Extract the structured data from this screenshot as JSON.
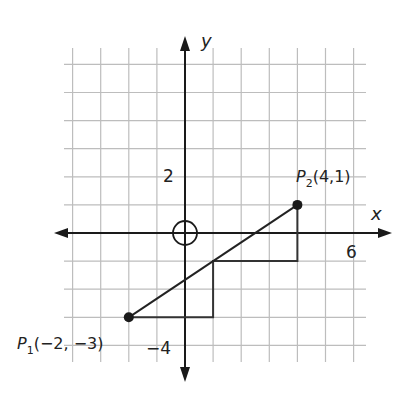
{
  "figure": {
    "axes": {
      "x_label": "x",
      "y_label": "y",
      "x_tick_label": "6",
      "y_tick_label_pos": "2",
      "y_tick_label_neg": "−4"
    },
    "origin_marker": "circle-crosshair",
    "points": [
      {
        "name": "P",
        "sub": "1",
        "coords": "(−2, −3)",
        "x": -2,
        "y": -3
      },
      {
        "name": "P",
        "sub": "2",
        "coords": "(4,1)",
        "x": 4,
        "y": 1
      }
    ],
    "segment": {
      "from": [
        -2,
        -3
      ],
      "to": [
        4,
        1
      ]
    },
    "staircase_path": [
      [
        -2,
        -3
      ],
      [
        1,
        -3
      ],
      [
        1,
        -1
      ],
      [
        4,
        -1
      ],
      [
        4,
        1
      ]
    ],
    "grid": {
      "x_min": -4,
      "x_max": 6,
      "y_min": -4,
      "y_max": 6,
      "step": 1
    }
  },
  "colors": {
    "grid": "#bdbdbd",
    "axis": "#1a1a1a",
    "line": "#222222"
  }
}
